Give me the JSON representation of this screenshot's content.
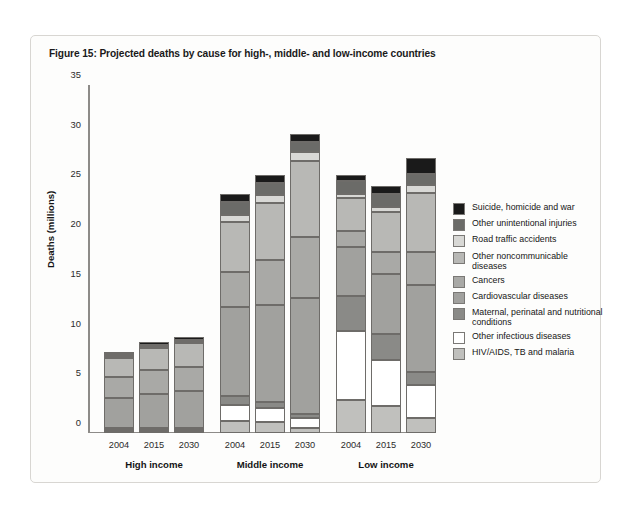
{
  "figure": {
    "title": "Figure 15: Projected deaths by cause for high-, middle- and low-income countries"
  },
  "chart_data": {
    "type": "bar",
    "subtype": "stacked-bar-grouped",
    "title": "Figure 15: Projected deaths by cause for high-, middle- and low-income countries",
    "xlabel": "",
    "ylabel": "Deaths (millions)",
    "ylim": [
      0,
      35
    ],
    "yticks": [
      0,
      5,
      10,
      15,
      20,
      25,
      30,
      35
    ],
    "grid": false,
    "legend_position": "right",
    "groups": [
      "High income",
      "Middle income",
      "Low income"
    ],
    "categories": [
      "2004",
      "2015",
      "2030"
    ],
    "series": [
      {
        "name": "HIV/AIDS, TB and malaria",
        "color": "#c0c0bd",
        "values": {
          "High income": [
            0.25,
            0.25,
            0.25
          ],
          "Middle income": [
            1.2,
            1.1,
            0.5
          ],
          "Low income": [
            3.3,
            2.7,
            1.5
          ]
        }
      },
      {
        "name": "Other infectious diseases",
        "color": "#ffffff",
        "values": {
          "High income": [
            0.2,
            0.2,
            0.2
          ],
          "Middle income": [
            1.6,
            1.4,
            1.0
          ],
          "Low income": [
            7.0,
            4.6,
            3.3
          ]
        }
      },
      {
        "name": "Maternal, perinatal and nutritional conditions",
        "color": "#8a8a87",
        "values": {
          "High income": [
            0.1,
            0.1,
            0.1
          ],
          "Middle income": [
            0.9,
            0.6,
            0.4
          ],
          "Low income": [
            3.5,
            2.7,
            1.3
          ]
        }
      },
      {
        "name": "Cardiovascular diseases",
        "color": "#a1a19e",
        "values": {
          "High income": [
            3.0,
            3.4,
            3.7
          ],
          "Middle income": [
            9.0,
            9.8,
            11.7
          ],
          "Low income": [
            4.9,
            6.0,
            8.8
          ]
        }
      },
      {
        "name": "Cancers",
        "color": "#a9a9a6",
        "values": {
          "High income": [
            2.1,
            2.4,
            2.4
          ],
          "Middle income": [
            3.5,
            4.5,
            6.1
          ],
          "Low income": [
            1.6,
            2.2,
            3.3
          ]
        }
      },
      {
        "name": "Other noncommunicable diseases",
        "color": "#b8b8b5",
        "values": {
          "High income": [
            1.9,
            2.2,
            2.4
          ],
          "Middle income": [
            5.0,
            5.7,
            7.7
          ],
          "Low income": [
            3.3,
            4.0,
            5.9
          ]
        }
      },
      {
        "name": "Road traffic accidents",
        "color": "#d8d8d5",
        "values": {
          "High income": [
            0.15,
            0.15,
            0.15
          ],
          "Middle income": [
            0.7,
            0.8,
            0.9
          ],
          "Low income": [
            0.4,
            0.5,
            0.8
          ]
        }
      },
      {
        "name": "Other unintentional injuries",
        "color": "#6b6b68",
        "values": {
          "High income": [
            0.2,
            0.2,
            0.2
          ],
          "Middle income": [
            1.3,
            1.2,
            1.0
          ],
          "Low income": [
            1.3,
            1.3,
            1.2
          ]
        }
      },
      {
        "name": "Suicide, homicide and war",
        "color": "#1a1a1a",
        "values": {
          "High income": [
            0.2,
            0.25,
            0.25
          ],
          "Middle income": [
            0.8,
            0.9,
            0.8
          ],
          "Low income": [
            0.7,
            0.8,
            1.6
          ]
        }
      }
    ],
    "totals": {
      "High income": [
        8.0,
        9.0,
        10.0
      ],
      "Middle income": [
        23.9,
        26.0,
        29.8
      ],
      "Low income": [
        26.0,
        25.3,
        27.7
      ]
    }
  },
  "axis": {
    "y_title": "Deaths (millions)",
    "y_ticks": [
      "0",
      "5",
      "10",
      "15",
      "20",
      "25",
      "30",
      "35"
    ],
    "x_ticks": [
      "2004",
      "2015",
      "2030"
    ],
    "group_labels": [
      "High income",
      "Middle income",
      "Low income"
    ]
  },
  "legend": {
    "items": [
      {
        "label": "Suicide, homicide and war",
        "color": "#1a1a1a"
      },
      {
        "label": "Other unintentional injuries",
        "color": "#6b6b68"
      },
      {
        "label": "Road traffic accidents",
        "color": "#d8d8d5"
      },
      {
        "label": "Other noncommunicable diseases",
        "color": "#b8b8b5"
      },
      {
        "label": "Cancers",
        "color": "#a9a9a6"
      },
      {
        "label": "Cardiovascular diseases",
        "color": "#a1a19e"
      },
      {
        "label": "Maternal, perinatal and nutritional conditions",
        "color": "#8a8a87"
      },
      {
        "label": "Other infectious diseases",
        "color": "#ffffff"
      },
      {
        "label": "HIV/AIDS, TB and malaria",
        "color": "#c0c0bd"
      }
    ]
  }
}
